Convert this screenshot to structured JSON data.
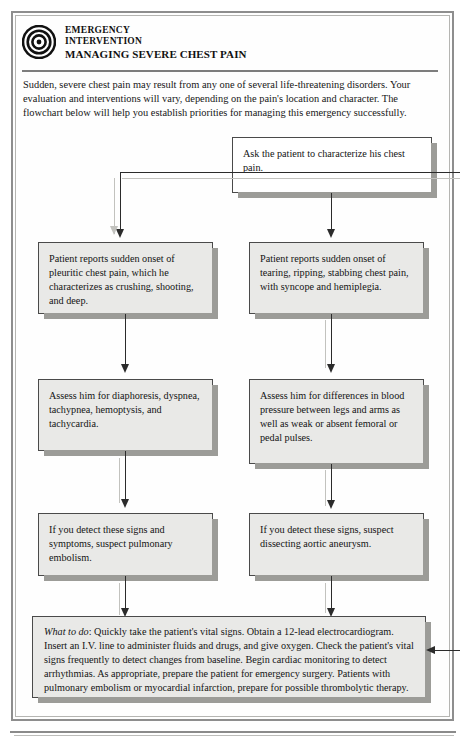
{
  "header": {
    "icon": "bullseye-target-icon",
    "line1": "EMERGENCY",
    "line2": "INTERVENTION",
    "line3": "MANAGING SEVERE CHEST PAIN"
  },
  "intro": {
    "text": "Sudden, severe chest pain may result from any one of several life-threatening disorders. Your evaluation and interventions will vary, depending on the pain's location and character. The flowchart below will help you establish priorities for managing this emergency successfully."
  },
  "flowchart": {
    "start": {
      "id": "ask-patient",
      "text": "Ask the patient to characterize his chest pain."
    },
    "branches": [
      {
        "id": "left-branch",
        "label": "pulmonary-embolism-path",
        "steps": [
          {
            "id": "left-symptom",
            "text": "Patient reports sudden onset of pleuritic chest pain, which he characterizes as crushing, shooting, and deep."
          },
          {
            "id": "left-assess",
            "text": "Assess him for diaphoresis, dyspnea, tachypnea, hemoptysis, and tachycardia."
          },
          {
            "id": "left-suspect",
            "text": "If you detect these signs and symptoms, suspect pulmonary embolism."
          }
        ]
      },
      {
        "id": "right-branch",
        "label": "aortic-dissection-path",
        "steps": [
          {
            "id": "right-symptom",
            "text": "Patient reports sudden onset of tearing, ripping, stabbing chest pain, with syncope and hemiplegia."
          },
          {
            "id": "right-assess",
            "text": "Assess him for differences in blood pressure between legs and arms as well as weak or absent femoral or pedal pulses."
          },
          {
            "id": "right-suspect",
            "text": "If you detect these signs, suspect dissecting aortic aneurysm."
          }
        ]
      }
    ],
    "outcome": {
      "id": "what-to-do",
      "lead": "What to do",
      "lead_separator": ": ",
      "text": "Quickly take the patient's vital signs. Obtain a 12-lead electrocardiogram. Insert an I.V. line to administer fluids and drugs, and give oxygen. Check the patient's vital signs frequently to detect changes from baseline. Begin cardiac monitoring to detect arrhythmias. As appropriate, prepare the patient for emergency surgery. Patients with pulmonary embolism or myocardial infarction, prepare for possible thrombolytic therapy."
    }
  },
  "colors": {
    "box_fill": "#e9e9e7",
    "box_fill_start": "#ffffff",
    "box_border": "#4a4a4a",
    "shadow": "#9c9c98",
    "connector": "#2b2b2b",
    "frame": "#8e8e8e",
    "page": "#ffffff"
  }
}
